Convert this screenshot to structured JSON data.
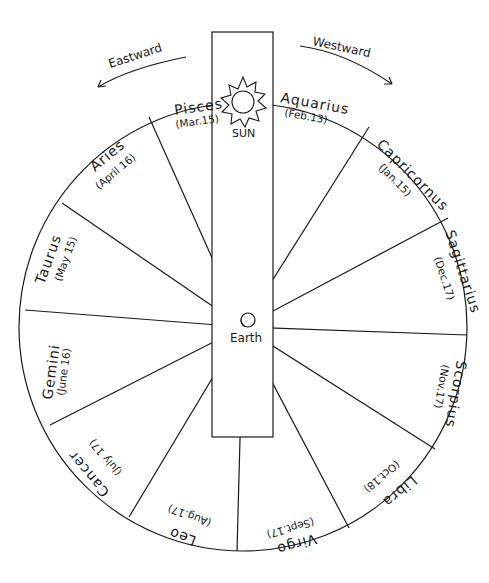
{
  "diagram": {
    "type": "zodiac-wheel",
    "directions": {
      "east": "Eastward",
      "west": "Westward"
    },
    "center_label": "Earth",
    "sun_label": "SUN",
    "constellations": [
      {
        "name": "Pisces",
        "date": "(Mar.15)"
      },
      {
        "name": "Aquarius",
        "date": "(Feb.13)"
      },
      {
        "name": "Capricornus",
        "date": "(Jan.15)"
      },
      {
        "name": "Sagittarius",
        "date": "(Dec.17)"
      },
      {
        "name": "Scorpius",
        "date": "(Nov.17)"
      },
      {
        "name": "Libra",
        "date": "(Oct.18)"
      },
      {
        "name": "Virgo",
        "date": "(Sept.17)"
      },
      {
        "name": "Leo",
        "date": "(Aug.17)"
      },
      {
        "name": "Cancer",
        "date": "(July 17)"
      },
      {
        "name": "Gemini",
        "date": "(June 16)"
      },
      {
        "name": "Taurus",
        "date": "(May 15)"
      },
      {
        "name": "Aries",
        "date": "(April 16)"
      }
    ],
    "colors": {
      "ink": "#1a1a1a",
      "background": "#ffffff"
    }
  }
}
